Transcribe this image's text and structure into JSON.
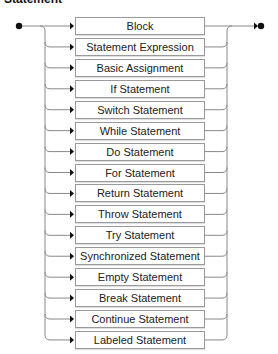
{
  "title": "Statement",
  "diagram": {
    "type": "railroad",
    "start_marker": "filled-dot",
    "end_marker": "arrow-dot",
    "choices": [
      "Block",
      "Statement Expression",
      "Basic Assignment",
      "If Statement",
      "Switch Statement",
      "While Statement",
      "Do Statement",
      "For Statement",
      "Return Statement",
      "Throw Statement",
      "Try Statement",
      "Synchronized Statement",
      "Empty Statement",
      "Break Statement",
      "Continue Statement",
      "Labeled Statement"
    ],
    "colors": {
      "line": "#8a8a8a",
      "marker": "#111111",
      "box_border": "#9a9a9a",
      "text": "#222222"
    }
  }
}
